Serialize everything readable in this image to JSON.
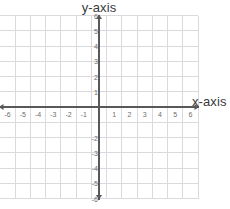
{
  "chart_data": {
    "type": "scatter",
    "title": "",
    "xlabel": "x-axis",
    "ylabel": "y-axis",
    "xlim": [
      -6,
      6
    ],
    "ylim": [
      -6,
      6
    ],
    "grid": true,
    "legend": null,
    "x_ticks": [
      -6,
      -5,
      -4,
      -3,
      -2,
      -1,
      1,
      2,
      3,
      4,
      5,
      6
    ],
    "y_ticks": [
      6,
      5,
      4,
      3,
      2,
      1,
      -2,
      -3,
      -4,
      -5,
      -6
    ],
    "x_tick_labels": [
      "-6",
      "-5",
      "-4",
      "-3",
      "-2",
      "-1",
      "1",
      "2",
      "3",
      "4",
      "5",
      "6"
    ],
    "y_tick_labels": [
      "6",
      "5",
      "4",
      "3",
      "2",
      "1",
      "-2",
      "-3",
      "-4",
      "-5",
      "-6"
    ],
    "series": [],
    "values": [],
    "annotations": [],
    "axis_arrows": [
      "left",
      "right",
      "up",
      "down"
    ],
    "grid_cells_x": 13,
    "grid_cells_y": 13
  },
  "titles": {
    "y_axis": "y-axis",
    "x_axis": "x-axis"
  },
  "colors": {
    "background": "#ffffff",
    "grid_line": "#d9d9de",
    "axis_line": "#585858",
    "tick_text": "#6e6e6e",
    "title_text": "#3a3a3a"
  }
}
